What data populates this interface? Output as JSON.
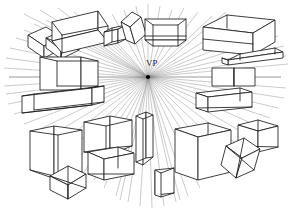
{
  "figure": {
    "background_color": "#ffffff",
    "width": 290,
    "height": 211,
    "line_color": "#1c1c1c",
    "ray_color": "#8a8a8a",
    "horizon_color": "#6e6e6e"
  },
  "vanishing_point": {
    "label": "VP",
    "x": 148,
    "y": 77,
    "label_x": 146,
    "label_y": 66,
    "dot_radius": 2.1
  },
  "horizon_line": {
    "name": "horizon-line",
    "x1": 9,
    "y1": 77,
    "x2": 281,
    "y2": 77
  },
  "rays": {
    "count": 64,
    "origin_x": 148,
    "origin_y": 77,
    "endpoints": [
      [
        24,
        14
      ],
      [
        40,
        10
      ],
      [
        58,
        8
      ],
      [
        74,
        12
      ],
      [
        88,
        18
      ],
      [
        100,
        24
      ],
      [
        112,
        14
      ],
      [
        124,
        10
      ],
      [
        136,
        6
      ],
      [
        148,
        4
      ],
      [
        160,
        6
      ],
      [
        172,
        10
      ],
      [
        184,
        8
      ],
      [
        198,
        12
      ],
      [
        212,
        16
      ],
      [
        226,
        12
      ],
      [
        240,
        18
      ],
      [
        254,
        22
      ],
      [
        268,
        28
      ],
      [
        278,
        36
      ],
      [
        284,
        46
      ],
      [
        286,
        56
      ],
      [
        288,
        64
      ],
      [
        286,
        88
      ],
      [
        284,
        98
      ],
      [
        278,
        108
      ],
      [
        270,
        118
      ],
      [
        262,
        128
      ],
      [
        252,
        138
      ],
      [
        242,
        148
      ],
      [
        232,
        158
      ],
      [
        222,
        168
      ],
      [
        212,
        178
      ],
      [
        200,
        188
      ],
      [
        188,
        196
      ],
      [
        176,
        202
      ],
      [
        164,
        206
      ],
      [
        152,
        208
      ],
      [
        140,
        206
      ],
      [
        128,
        202
      ],
      [
        116,
        196
      ],
      [
        104,
        188
      ],
      [
        94,
        180
      ],
      [
        84,
        172
      ],
      [
        74,
        164
      ],
      [
        64,
        156
      ],
      [
        54,
        148
      ],
      [
        44,
        140
      ],
      [
        34,
        132
      ],
      [
        24,
        124
      ],
      [
        14,
        114
      ],
      [
        8,
        104
      ],
      [
        6,
        94
      ],
      [
        4,
        86
      ],
      [
        4,
        68
      ],
      [
        6,
        58
      ],
      [
        10,
        48
      ],
      [
        16,
        38
      ],
      [
        24,
        30
      ],
      [
        34,
        24
      ],
      [
        46,
        20
      ],
      [
        60,
        18
      ],
      [
        120,
        200
      ],
      [
        180,
        200
      ]
    ]
  },
  "boxes": [
    {
      "name": "box-top-left-large",
      "desc": "wireframe rectangular prism upper left"
    },
    {
      "name": "box-top-left-tilted",
      "desc": "tilted rhomboid box far upper left"
    },
    {
      "name": "box-top-left-small",
      "desc": "small tilted box below left cluster"
    },
    {
      "name": "box-upper-mid-small",
      "desc": "small cube upper middle left"
    },
    {
      "name": "box-upper-mid-tilted",
      "desc": "tilted tall box upper middle"
    },
    {
      "name": "box-top-center-open",
      "desc": "open trapezoid box top center"
    },
    {
      "name": "box-top-right-large",
      "desc": "large wireframe prism top right"
    },
    {
      "name": "box-right-elongated",
      "desc": "elongated angled bar upper right"
    },
    {
      "name": "box-mid-left-square",
      "desc": "square box straddling horizon left"
    },
    {
      "name": "box-mid-left-beam",
      "desc": "long low beam below left horizon"
    },
    {
      "name": "box-mid-right-small",
      "desc": "small box on horizon right"
    },
    {
      "name": "box-mid-right-beam",
      "desc": "long beam below right horizon"
    },
    {
      "name": "box-lower-left-cube",
      "desc": "large cube lower left"
    },
    {
      "name": "box-lower-left-tilted",
      "desc": "tilted cube bottom left"
    },
    {
      "name": "box-lower-mid-cube-a",
      "desc": "cube lower middle upper"
    },
    {
      "name": "box-lower-mid-cube-b",
      "desc": "cube lower middle lower"
    },
    {
      "name": "box-lower-center-tall",
      "desc": "tall narrow column bottom center"
    },
    {
      "name": "box-bottom-center-small",
      "desc": "small box bottom center"
    },
    {
      "name": "box-lower-right-large",
      "desc": "large cube lower right"
    },
    {
      "name": "box-lower-right-small",
      "desc": "small wireframe box right"
    },
    {
      "name": "box-bottom-right-tilted",
      "desc": "tilted cube bottom right"
    }
  ]
}
